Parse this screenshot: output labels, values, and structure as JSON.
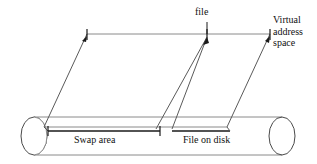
{
  "figure": {
    "labels": {
      "file": "file",
      "virtual_address_space_line1": "Virtual",
      "virtual_address_space_line2": "address",
      "virtual_address_space_line3": "space",
      "swap_area": "Swap area",
      "file_on_disk": "File on disk"
    },
    "colors": {
      "stroke_dark": "#1a1a1a",
      "stroke_gray": "#8a8a8a",
      "background": "#ffffff",
      "text": "#111111"
    },
    "geometry": {
      "parallelogram_top_y": 34,
      "parallelogram_top_x_start": 87,
      "parallelogram_top_x_end": 270,
      "parallelogram_bottom_y": 127,
      "parallelogram_bottom_x_start": 44,
      "parallelogram_bottom_x_end": 227,
      "cylinder_top_y": 117,
      "cylinder_bottom_y": 155,
      "cylinder_left_cap_cx": 34,
      "cylinder_right_cap_cx": 282,
      "cylinder_cap_rx": 13,
      "cylinder_cap_ry": 19,
      "swap_area_bar_y": 131,
      "swap_area_bar_x_start": 48,
      "swap_area_bar_x_end": 160,
      "file_on_disk_bar_y": 131,
      "file_on_disk_bar_x_start": 172,
      "file_on_disk_bar_x_end": 230,
      "file_tick_x": 207,
      "vas_tick_x": 270,
      "swap_tick_x": 87
    }
  }
}
